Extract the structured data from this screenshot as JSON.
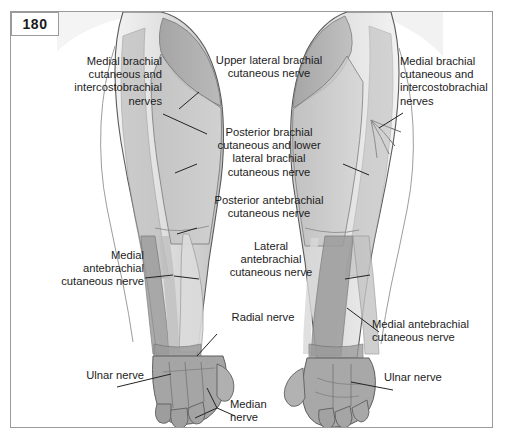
{
  "page": {
    "number": "180",
    "frame_color": "#9a9a9a",
    "background_color": "#ffffff",
    "text_color": "#1c1c1c"
  },
  "figure": {
    "views": [
      {
        "name": "posterior-view-arm",
        "side": "left"
      },
      {
        "name": "anterior-view-arm",
        "side": "right"
      }
    ],
    "palette": {
      "skin_light": "#e9e9e9",
      "skin_mid": "#c8c8c8",
      "skin_dark": "#a8a8a8",
      "band_dark": "#8f8f8f",
      "band_mid": "#b4b4b4",
      "band_light": "#d6d6d6",
      "outline": "#4a4a4a",
      "leader": "#2b2b2b"
    }
  },
  "labels": {
    "medial_brachial_left": "Medial brachial\ncutaneous and\nintercostobrachial\nnerves",
    "upper_lateral_brachial": "Upper lateral brachial\ncutaneous nerve",
    "medial_brachial_right": "Medial brachial\ncutaneous and\nintercostobrachial\nnerves",
    "posterior_brachial": "Posterior brachial\ncutaneous and lower\nlateral brachial\ncutaneous nerve",
    "posterior_antebrachial": "Posterior antebrachial\ncutaneous nerve",
    "medial_antebrachial_left": "Medial\nantebrachial\ncutaneous nerve",
    "lateral_antebrachial": "Lateral\nantebrachial\ncutaneous nerve",
    "radial_nerve": "Radial nerve",
    "medial_antebrachial_right": "Medial antebrachial\ncutaneous nerve",
    "ulnar_nerve_left": "Ulnar nerve",
    "ulnar_nerve_right": "Ulnar nerve",
    "median_nerve": "Median\nnerve"
  }
}
